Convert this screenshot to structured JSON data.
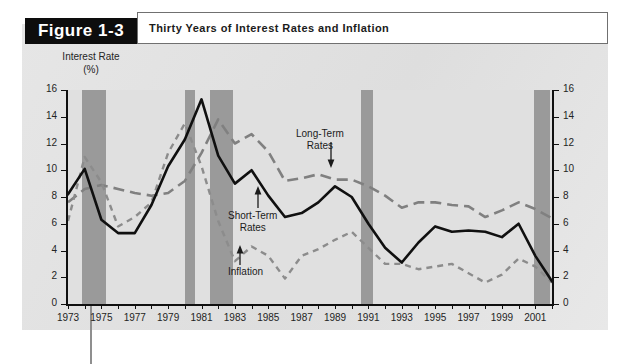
{
  "figure": {
    "tag": "Figure 1-3",
    "title": "Thirty Years of Interest Rates and Inflation"
  },
  "axes": {
    "y_title_line1": "Interest Rate",
    "y_title_line2": "(%)",
    "y_ticks": [
      "0",
      "2",
      "4",
      "6",
      "8",
      "10",
      "12",
      "14",
      "16"
    ],
    "x_ticks": [
      "1973",
      "1975",
      "1977",
      "1979",
      "1981",
      "1983",
      "1985",
      "1987",
      "1989",
      "1991",
      "1993",
      "1995",
      "1997",
      "1999",
      "2001"
    ]
  },
  "annotations": {
    "long_term_l1": "Long-Term",
    "long_term_l2": "Rates",
    "short_term_l1": "Short-Term",
    "short_term_l2": "Rates",
    "inflation": "Inflation"
  },
  "colors": {
    "page": "#ffffff",
    "figure_body": "#e3e3e3",
    "plot_bg": "#e0e0e0",
    "recession_band": "#9a9a9a",
    "axis": "#101010",
    "short_term": "#101010",
    "long_term": "#808080",
    "inflation": "#8c8c8c",
    "tag_bg": "#0d0d0d",
    "tag_fg": "#ffffff"
  },
  "chart_data": {
    "type": "line",
    "title": "Thirty Years of Interest Rates and Inflation",
    "xlabel": "",
    "ylabel": "Interest Rate (%)",
    "xlim": [
      1973,
      2002
    ],
    "ylim": [
      0,
      16
    ],
    "ytick_step": 2,
    "xtick_step": 1,
    "grid": false,
    "legend": "annotations-inline",
    "x": [
      1973,
      1974,
      1975,
      1976,
      1977,
      1978,
      1979,
      1980,
      1981,
      1982,
      1983,
      1984,
      1985,
      1986,
      1987,
      1988,
      1989,
      1990,
      1991,
      1992,
      1993,
      1994,
      1995,
      1996,
      1997,
      1998,
      1999,
      2000,
      2001,
      2002
    ],
    "series": [
      {
        "name": "Short-Term Rates",
        "style": "solid",
        "color": "#101010",
        "values": [
          8.2,
          10.1,
          6.3,
          5.3,
          5.3,
          7.4,
          10.3,
          12.3,
          15.3,
          11.1,
          9.0,
          10.0,
          8.1,
          6.5,
          6.8,
          7.6,
          8.8,
          8.0,
          6.0,
          4.2,
          3.1,
          4.6,
          5.8,
          5.4,
          5.5,
          5.4,
          5.0,
          6.0,
          3.6,
          1.7
        ]
      },
      {
        "name": "Long-Term Rates",
        "style": "long-dash",
        "color": "#808080",
        "values": [
          7.6,
          8.6,
          8.9,
          8.6,
          8.3,
          8.1,
          8.3,
          9.2,
          11.3,
          13.8,
          12.0,
          12.7,
          11.4,
          9.2,
          9.4,
          9.7,
          9.3,
          9.3,
          8.8,
          8.1,
          7.2,
          7.6,
          7.6,
          7.4,
          7.3,
          6.5,
          7.0,
          7.6,
          7.1,
          6.4
        ]
      },
      {
        "name": "Inflation",
        "style": "short-dash",
        "color": "#8c8c8c",
        "values": [
          6.2,
          11.0,
          9.1,
          5.8,
          6.5,
          7.6,
          11.3,
          13.5,
          10.3,
          6.2,
          3.2,
          4.3,
          3.6,
          1.9,
          3.6,
          4.1,
          4.8,
          5.4,
          4.2,
          3.0,
          3.0,
          2.6,
          2.8,
          3.0,
          2.3,
          1.6,
          2.2,
          3.4,
          2.8,
          1.6
        ]
      }
    ],
    "recession_bands": [
      {
        "start": 1973.85,
        "end": 1975.25
      },
      {
        "start": 1980.0,
        "end": 1980.6
      },
      {
        "start": 1981.5,
        "end": 1982.9
      },
      {
        "start": 1990.55,
        "end": 1991.3
      },
      {
        "start": 2000.95,
        "end": 2001.9
      }
    ]
  }
}
